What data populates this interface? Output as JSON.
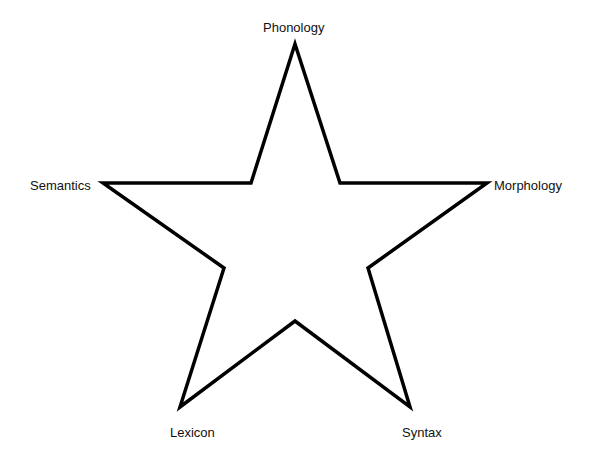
{
  "diagram": {
    "type": "star",
    "stroke_color": "#000000",
    "fill_color": "#ffffff",
    "points": [
      {
        "id": "top",
        "label": "Phonology"
      },
      {
        "id": "right",
        "label": "Morphology"
      },
      {
        "id": "bottom-right",
        "label": "Syntax"
      },
      {
        "id": "bottom-left",
        "label": "Lexicon"
      },
      {
        "id": "left",
        "label": "Semantics"
      }
    ]
  }
}
